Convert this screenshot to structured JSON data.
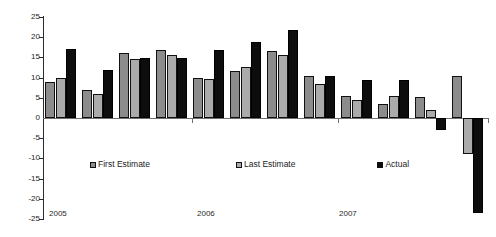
{
  "chart_data": {
    "type": "bar",
    "title": "",
    "subtitle": "",
    "xlabel": "",
    "ylabel": "",
    "ylim": [
      -25,
      25
    ],
    "ytick_step": 5,
    "grid": false,
    "legend_position": "inside-bottom-center",
    "yticks": [
      "25",
      "20",
      "15",
      "10",
      "5",
      "0",
      "-5",
      "-10",
      "-15",
      "-20",
      "-25"
    ],
    "ytick_values": [
      25,
      20,
      15,
      10,
      5,
      0,
      -5,
      -10,
      -15,
      -20,
      -25
    ],
    "categories": [
      "1",
      "2",
      "3",
      "4",
      "5",
      "6",
      "7",
      "8",
      "9",
      "10",
      "11",
      "12"
    ],
    "group_axis_labels": [
      "2005",
      "2006",
      "2007"
    ],
    "series": [
      {
        "name": "First Estimate",
        "color": "#8c8c8c",
        "values": [
          9.0,
          7.0,
          16.0,
          16.8,
          9.8,
          11.7,
          16.7,
          10.5,
          5.5,
          3.4,
          5.1,
          10.3
        ]
      },
      {
        "name": "Last Estimate",
        "color": "#ababab",
        "values": [
          10.0,
          5.9,
          14.6,
          15.7,
          9.7,
          12.7,
          15.6,
          8.5,
          4.5,
          5.4,
          2.1,
          -9.0
        ]
      },
      {
        "name": "Actual",
        "color": "#0d0d0d",
        "values": [
          17.0,
          12.0,
          14.9,
          14.8,
          16.8,
          18.7,
          21.7,
          10.5,
          9.5,
          9.5,
          -3.0,
          -23.5
        ]
      }
    ]
  },
  "legend": {
    "entries": [
      {
        "label": "First Estimate",
        "swatch": "first"
      },
      {
        "label": "Last Estimate",
        "swatch": "last"
      },
      {
        "label": "Actual",
        "swatch": "actual"
      }
    ]
  },
  "axis": {
    "year_labels": [
      {
        "text": "2005",
        "left": 49
      },
      {
        "text": "2006",
        "left": 197
      },
      {
        "text": "2007",
        "left": 339
      }
    ]
  }
}
